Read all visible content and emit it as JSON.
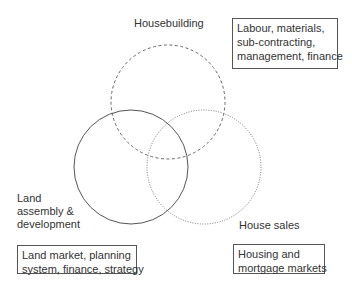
{
  "circles": {
    "housebuilding": {
      "label": "Housebuilding",
      "style": "dashed"
    },
    "land": {
      "label_lines": [
        "Land",
        "assembly &",
        "development"
      ],
      "style": "solid"
    },
    "sales": {
      "label": "House sales",
      "style": "dotted"
    }
  },
  "boxes": {
    "housebuilding": {
      "lines": [
        "Labour, materials,",
        "sub-contracting,",
        "management, finance"
      ]
    },
    "land": {
      "lines": [
        "Land market, planning",
        "system, finance, strategy"
      ]
    },
    "sales": {
      "lines": [
        "Housing and",
        "mortgage markets"
      ]
    }
  },
  "colors": {
    "stroke": "#555555",
    "text": "#333333"
  }
}
